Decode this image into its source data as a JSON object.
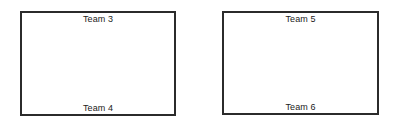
{
  "diagram": {
    "background_color": "#ffffff",
    "line_color": "#2b2b2b",
    "text_color": "#1a1a1a",
    "boxes": [
      {
        "id": "left",
        "name": "left-court-box",
        "top_label": "Team 3",
        "bottom_label": "Team 4"
      },
      {
        "id": "right",
        "name": "right-court-box",
        "top_label": "Team 5",
        "bottom_label": "Team 6"
      }
    ]
  }
}
